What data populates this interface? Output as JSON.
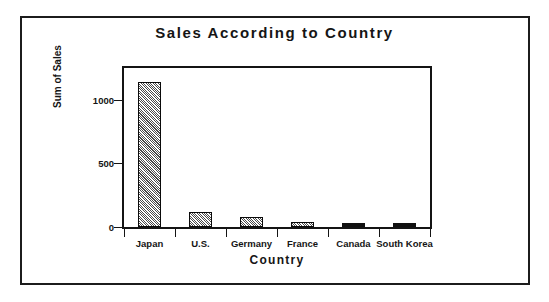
{
  "chart_data": {
    "type": "bar",
    "title": "Sales According to Country",
    "xlabel": "Country",
    "ylabel": "Sum of Sales",
    "categories": [
      "Japan",
      "U.S.",
      "Germany",
      "France",
      "Canada",
      "South Korea"
    ],
    "values": [
      1140,
      115,
      80,
      42,
      20,
      20
    ],
    "ylim": [
      0,
      1250
    ],
    "yticks": [
      0,
      500,
      1000
    ],
    "ytick_labels": [
      "0",
      "500",
      "1000"
    ],
    "grid": false,
    "legend": "none",
    "bar_styles": [
      "hatched",
      "hatched",
      "hatched",
      "hatched",
      "solid",
      "solid"
    ],
    "colors": {
      "frame": "#141414",
      "bar_fill": "#4a4a4a",
      "bar_edge": "#0a0a0a",
      "solid_bar": "#101010",
      "background": "#ffffff",
      "text": "#151515"
    }
  },
  "figure": {
    "border_color": "#1c1c1c"
  }
}
